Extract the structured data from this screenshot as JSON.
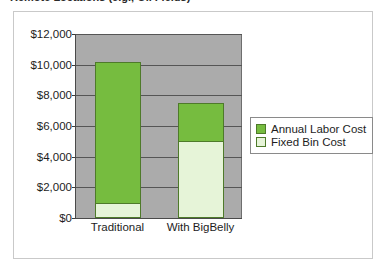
{
  "title_strip": {
    "text": "Remote Locations (e.g., Oil Fields)"
  },
  "chart_data": {
    "type": "bar",
    "subtype": "stacked-column",
    "title": "",
    "xlabel": "",
    "ylabel": "",
    "categories": [
      "Traditional",
      "With BigBelly"
    ],
    "series": [
      {
        "name": "Annual Labor Cost",
        "color": "#76bc3f",
        "values": [
          9200,
          2500
        ]
      },
      {
        "name": "Fixed Bin Cost",
        "color": "#e6f4d8",
        "values": [
          1000,
          5000
        ]
      }
    ],
    "stack_totals": [
      10200,
      7500
    ],
    "ylim": [
      0,
      12000
    ],
    "ytick_values": [
      0,
      2000,
      4000,
      6000,
      8000,
      10000,
      12000
    ],
    "ytick_labels": [
      "$0",
      "$2,000",
      "$4,000",
      "$6,000",
      "$8,000",
      "$10,000",
      "$12,000"
    ],
    "grid": true,
    "legend_position": "right",
    "plot_background": "#ababab",
    "legend": [
      "Annual Labor Cost",
      "Fixed Bin Cost"
    ]
  }
}
